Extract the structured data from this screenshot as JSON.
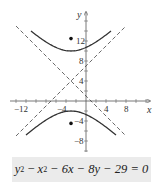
{
  "chart_data": {
    "type": "line",
    "title": "",
    "xlabel": "x",
    "ylabel": "y",
    "x_ticks": [
      "-12",
      "-4",
      "4",
      "8"
    ],
    "y_ticks": [
      "12",
      "8",
      "4",
      "-4",
      "-8"
    ],
    "xlim": [
      -16,
      12
    ],
    "ylim": [
      -10,
      17
    ],
    "grid": false,
    "equation": "y² − x² − 6x − 8y − 29 = 0",
    "center": [
      -3,
      4
    ],
    "foci": [
      [
        -3,
        12.49
      ],
      [
        -3,
        -4.49
      ]
    ],
    "series": [
      {
        "name": "upper branch",
        "style": "solid",
        "equation": "y = 4 + sqrt(36 + (x+3)^2)",
        "x_range": [
          -11,
          5
        ]
      },
      {
        "name": "lower branch",
        "style": "solid",
        "equation": "y = 4 - sqrt(36 + (x+3)^2)",
        "x_range": [
          -12,
          6
        ]
      },
      {
        "name": "asymptote 1",
        "style": "dashed",
        "equation": "y = x + 7",
        "x_range": [
          -14,
          8
        ]
      },
      {
        "name": "asymptote 2",
        "style": "dashed",
        "equation": "y = -x + 1",
        "x_range": [
          -14,
          8
        ]
      }
    ]
  },
  "labels": {
    "x_axis": "x",
    "y_axis": "y",
    "tick_x_m12": "−12",
    "tick_x_m4": "−4",
    "tick_x_4": "4",
    "tick_x_8": "8",
    "tick_y_12": "12",
    "tick_y_8": "8",
    "tick_y_4": "4",
    "tick_y_m4": "−4",
    "tick_y_m8": "−8"
  },
  "equation": {
    "y": "y",
    "sup1": "2",
    "minus1": " − ",
    "x": "x",
    "sup2": "2",
    "rest": " − 6x − 8y − 29 = 0"
  }
}
